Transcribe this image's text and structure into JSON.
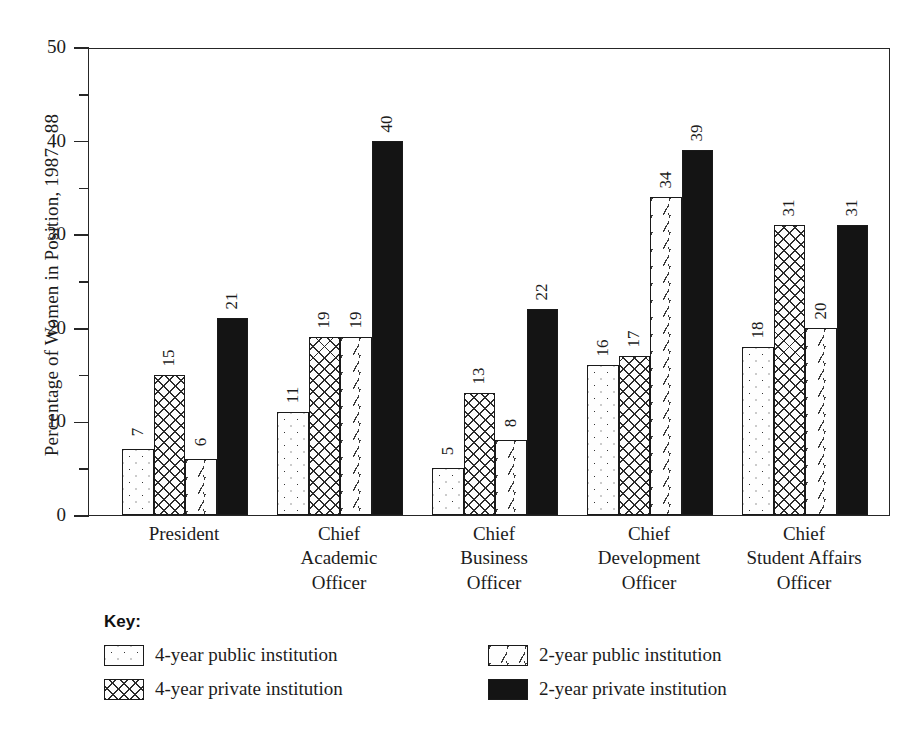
{
  "chart_data": {
    "type": "bar",
    "title": "",
    "xlabel": "",
    "ylabel": "Percentage of Women in Position, 1987– 88",
    "ylim": [
      0,
      50
    ],
    "yticks": [
      0,
      10,
      20,
      30,
      40,
      50
    ],
    "yticks_minor": [
      5,
      15,
      25,
      35,
      45
    ],
    "grid": false,
    "legend_position": "below-plot",
    "legend_title": "Key:",
    "categories": [
      "President",
      "Chief\nAcademic\nOfficer",
      "Chief\nBusiness\nOfficer",
      "Chief\nDevelopment\nOfficer",
      "Chief\nStudent Affairs\nOfficer"
    ],
    "category_lines": [
      [
        "President"
      ],
      [
        "Chief",
        "Academic",
        "Officer"
      ],
      [
        "Chief",
        "Business",
        "Officer"
      ],
      [
        "Chief",
        "Development",
        "Officer"
      ],
      [
        "Chief",
        "Student Affairs",
        "Officer"
      ]
    ],
    "series": [
      {
        "name": "4-year public institution",
        "pattern": "dots",
        "values": [
          7,
          11,
          5,
          16,
          18
        ]
      },
      {
        "name": "4-year private institution",
        "pattern": "crosshatch",
        "values": [
          15,
          19,
          13,
          17,
          31
        ]
      },
      {
        "name": "2-year public institution",
        "pattern": "dashes",
        "values": [
          6,
          19,
          8,
          34,
          20
        ]
      },
      {
        "name": "2-year private institution",
        "pattern": "solid-black",
        "values": [
          21,
          40,
          22,
          39,
          31
        ]
      }
    ]
  },
  "axis": {
    "y_title": "Percentage of Women in Position, 1987– 88",
    "tick_labels": [
      "0",
      "10",
      "20",
      "30",
      "40",
      "50"
    ]
  },
  "legend": {
    "title": "Key:",
    "items": [
      {
        "label": "4-year public institution",
        "pattern": "dots"
      },
      {
        "label": "2-year public institution",
        "pattern": "dashes"
      },
      {
        "label": "4-year private institution",
        "pattern": "crosshatch"
      },
      {
        "label": "2-year private institution",
        "pattern": "solid-black"
      }
    ]
  },
  "colors": {
    "background": "#ffffff",
    "ink": "#1a1a1a",
    "solid_fill": "#141414",
    "pattern_fill_bg": "#fefefe"
  }
}
